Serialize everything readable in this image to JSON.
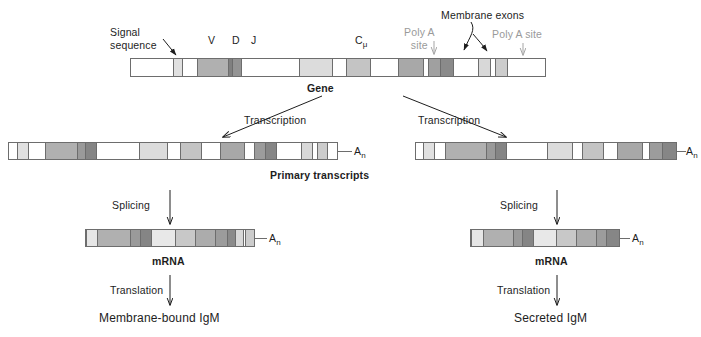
{
  "figure": {
    "background": "#ffffff"
  },
  "palette": {
    "white": "#ffffff",
    "light": "#e2e2e2",
    "light2": "#d2d2d2",
    "mid": "#b4b4b4",
    "mid2": "#a8a8a8",
    "dark": "#8d8d8d",
    "darker": "#7a7a7a",
    "outline": "#6d6d6d",
    "text": "#1d1d1d",
    "gray_text": "#9a9a9a"
  },
  "labels": {
    "signal_sequence": "Signal\nsequence",
    "signal_sequence_line1": "Signal",
    "signal_sequence_line2": "sequence",
    "v": "V",
    "d": "D",
    "j": "J",
    "c_mu": "C",
    "c_mu_sub": "μ",
    "membrane_exons": "Membrane exons",
    "poly_a_site_left_line1": "Poly A",
    "poly_a_site_left_line2": "site",
    "poly_a_site_right": "Poly A site",
    "gene": "Gene",
    "transcription_left": "Transcription",
    "transcription_right": "Transcription",
    "primary_transcripts": "Primary transcripts",
    "splicing_left": "Splicing",
    "splicing_right": "Splicing",
    "mrna_left": "mRNA",
    "mrna_right": "mRNA",
    "translation_left": "Translation",
    "translation_right": "Translation",
    "product_left": "Membrane-bound IgM",
    "product_right": "Secreted IgM",
    "poly_a_tail_left": "A",
    "poly_a_tail_left_sub": "n",
    "poly_a_tail_right": "A",
    "poly_a_tail_right_sub": "n",
    "mrna_tail_left": "A",
    "mrna_tail_left_sub": "n",
    "mrna_tail_right": "A",
    "mrna_tail_right_sub": "n"
  },
  "chart_data": {
    "type": "diagram",
    "bars": [
      {
        "name": "gene",
        "x": 130,
        "y": 58,
        "width": 416,
        "height": 19,
        "segments": [
          {
            "w": 42,
            "color": "#ffffff",
            "label": ""
          },
          {
            "w": 9,
            "color": "#e0e0e0",
            "label": "signal sequence"
          },
          {
            "w": 15,
            "color": "#ffffff",
            "label": ""
          },
          {
            "w": 31,
            "color": "#b0b0b0",
            "label": "V"
          },
          {
            "w": 5,
            "color": "#808080",
            "label": "D"
          },
          {
            "w": 9,
            "color": "#949494",
            "label": "J"
          },
          {
            "w": 58,
            "color": "#ffffff",
            "label": ""
          },
          {
            "w": 33,
            "color": "#dcdcdc",
            "label": "C mu 1"
          },
          {
            "w": 14,
            "color": "#ffffff",
            "label": ""
          },
          {
            "w": 24,
            "color": "#c4c4c4",
            "label": "C mu 2"
          },
          {
            "w": 28,
            "color": "#ffffff",
            "label": ""
          },
          {
            "w": 25,
            "color": "#a8a8a8",
            "label": "C mu 3"
          },
          {
            "w": 6,
            "color": "#ffffff",
            "label": ""
          },
          {
            "w": 12,
            "color": "#a0a0a0",
            "label": "C mu 4"
          },
          {
            "w": 13,
            "color": "#8a8a8a",
            "label": "C mu 4s"
          },
          {
            "w": 25,
            "color": "#ffffff",
            "label": ""
          },
          {
            "w": 12,
            "color": "#d8d8d8",
            "label": "M1"
          },
          {
            "w": 5,
            "color": "#ffffff",
            "label": ""
          },
          {
            "w": 12,
            "color": "#cccccc",
            "label": "M2"
          },
          {
            "w": 38,
            "color": "#ffffff",
            "label": ""
          }
        ]
      },
      {
        "name": "primary-transcript-left",
        "x": 8,
        "y": 142,
        "width": 330,
        "height": 18,
        "segments": [
          {
            "w": 10,
            "color": "#ffffff"
          },
          {
            "w": 14,
            "color": "#e0e0e0"
          },
          {
            "w": 22,
            "color": "#ffffff"
          },
          {
            "w": 40,
            "color": "#b0b0b0"
          },
          {
            "w": 11,
            "color": "#9a9a9a"
          },
          {
            "w": 14,
            "color": "#858585"
          },
          {
            "w": 54,
            "color": "#ffffff"
          },
          {
            "w": 36,
            "color": "#dcdcdc"
          },
          {
            "w": 16,
            "color": "#ffffff"
          },
          {
            "w": 27,
            "color": "#c4c4c4"
          },
          {
            "w": 24,
            "color": "#ffffff"
          },
          {
            "w": 31,
            "color": "#a8a8a8"
          },
          {
            "w": 12,
            "color": "#ffffff"
          },
          {
            "w": 14,
            "color": "#9c9c9c"
          },
          {
            "w": 15,
            "color": "#868686"
          },
          {
            "w": 32,
            "color": "#ffffff"
          },
          {
            "w": 13,
            "color": "#d8d8d8"
          },
          {
            "w": 7,
            "color": "#ffffff"
          },
          {
            "w": 13,
            "color": "#cccccc"
          },
          {
            "w": 12,
            "color": "#ffffff"
          }
        ]
      },
      {
        "name": "primary-transcript-right",
        "x": 415,
        "y": 142,
        "width": 262,
        "height": 18,
        "segments": [
          {
            "w": 8,
            "color": "#ffffff"
          },
          {
            "w": 13,
            "color": "#e0e0e0"
          },
          {
            "w": 14,
            "color": "#ffffff"
          },
          {
            "w": 48,
            "color": "#b0b0b0"
          },
          {
            "w": 11,
            "color": "#9a9a9a"
          },
          {
            "w": 13,
            "color": "#858585"
          },
          {
            "w": 49,
            "color": "#ffffff"
          },
          {
            "w": 30,
            "color": "#dcdcdc"
          },
          {
            "w": 12,
            "color": "#ffffff"
          },
          {
            "w": 25,
            "color": "#c4c4c4"
          },
          {
            "w": 17,
            "color": "#ffffff"
          },
          {
            "w": 30,
            "color": "#a8a8a8"
          },
          {
            "w": 8,
            "color": "#ffffff"
          },
          {
            "w": 15,
            "color": "#9c9c9c"
          },
          {
            "w": 17,
            "color": "#868686"
          }
        ]
      },
      {
        "name": "mrna-left",
        "x": 85,
        "y": 229,
        "width": 170,
        "height": 18,
        "segments": [
          {
            "w": 12,
            "color": "#e6e6e6"
          },
          {
            "w": 36,
            "color": "#b0b0b0"
          },
          {
            "w": 10,
            "color": "#9a9a9a"
          },
          {
            "w": 12,
            "color": "#858585"
          },
          {
            "w": 26,
            "color": "#e8e8e8"
          },
          {
            "w": 22,
            "color": "#c8c8c8"
          },
          {
            "w": 22,
            "color": "#acacac"
          },
          {
            "w": 13,
            "color": "#9c9c9c"
          },
          {
            "w": 8,
            "color": "#8a8a8a"
          },
          {
            "w": 9,
            "color": "#d8d8d8"
          },
          {
            "w": 2,
            "color": "#ffffff"
          },
          {
            "w": 10,
            "color": "#cccccc"
          }
        ]
      },
      {
        "name": "mrna-right",
        "x": 470,
        "y": 229,
        "width": 150,
        "height": 18,
        "segments": [
          {
            "w": 13,
            "color": "#e6e6e6"
          },
          {
            "w": 33,
            "color": "#b0b0b0"
          },
          {
            "w": 9,
            "color": "#9a9a9a"
          },
          {
            "w": 13,
            "color": "#858585"
          },
          {
            "w": 24,
            "color": "#e8e8e8"
          },
          {
            "w": 22,
            "color": "#c8c8c8"
          },
          {
            "w": 22,
            "color": "#acacac"
          },
          {
            "w": 11,
            "color": "#9c9c9c"
          },
          {
            "w": 14,
            "color": "#868686"
          }
        ]
      }
    ],
    "arrows": [
      {
        "name": "signal-sequence-pointer",
        "from": [
          168,
          40
        ],
        "to": [
          177,
          55
        ],
        "color": "#1d1d1d"
      },
      {
        "name": "poly-a-left-arrow",
        "from": [
          434,
          40
        ],
        "to": [
          434,
          55
        ],
        "color": "#9a9a9a"
      },
      {
        "name": "poly-a-right-arrow",
        "from": [
          524,
          42
        ],
        "to": [
          524,
          55
        ],
        "color": "#9a9a9a"
      },
      {
        "name": "membrane-exon-arrow-1",
        "from": [
          478,
          30
        ],
        "to": [
          466,
          52
        ],
        "color": "#1d1d1d"
      },
      {
        "name": "membrane-exon-arrow-2",
        "from": [
          478,
          30
        ],
        "to": [
          488,
          52
        ],
        "color": "#1d1d1d"
      },
      {
        "name": "transcription-arrow-left",
        "from": [
          320,
          97
        ],
        "to": [
          222,
          138
        ],
        "color": "#1d1d1d"
      },
      {
        "name": "transcription-arrow-right",
        "from": [
          404,
          97
        ],
        "to": [
          505,
          138
        ],
        "color": "#1d1d1d"
      },
      {
        "name": "splicing-arrow-left",
        "from": [
          170,
          192
        ],
        "to": [
          170,
          224
        ],
        "color": "#1d1d1d"
      },
      {
        "name": "splicing-arrow-right",
        "from": [
          557,
          192
        ],
        "to": [
          557,
          224
        ],
        "color": "#1d1d1d"
      },
      {
        "name": "translation-arrow-left",
        "from": [
          170,
          277
        ],
        "to": [
          170,
          305
        ],
        "color": "#1d1d1d"
      },
      {
        "name": "translation-arrow-right",
        "from": [
          557,
          277
        ],
        "to": [
          557,
          305
        ],
        "color": "#1d1d1d"
      }
    ]
  }
}
